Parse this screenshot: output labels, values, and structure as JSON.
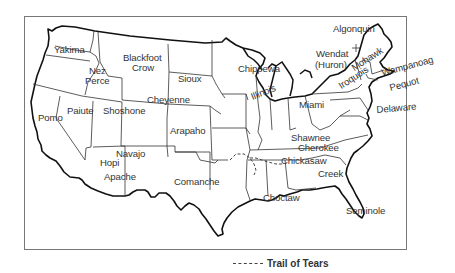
{
  "map": {
    "title": "Native American Tribes of the United States",
    "tribes": [
      {
        "name": "Yakima",
        "x": 54,
        "y": 45
      },
      {
        "name": "Nez",
        "x": 89,
        "y": 66
      },
      {
        "name": "Perce",
        "x": 85,
        "y": 76
      },
      {
        "name": "Blackfoot",
        "x": 123,
        "y": 53
      },
      {
        "name": "Crow",
        "x": 132,
        "y": 63
      },
      {
        "name": "Sioux",
        "x": 178,
        "y": 74
      },
      {
        "name": "Cheyenne",
        "x": 147,
        "y": 95
      },
      {
        "name": "Shoshone",
        "x": 103,
        "y": 106
      },
      {
        "name": "Paiute",
        "x": 67,
        "y": 106
      },
      {
        "name": "Pomo",
        "x": 38,
        "y": 113
      },
      {
        "name": "Arapaho",
        "x": 170,
        "y": 126
      },
      {
        "name": "Navajo",
        "x": 116,
        "y": 149
      },
      {
        "name": "Hopi",
        "x": 100,
        "y": 158
      },
      {
        "name": "Apache",
        "x": 104,
        "y": 172
      },
      {
        "name": "Comanche",
        "x": 174,
        "y": 177
      },
      {
        "name": "Chippewa",
        "x": 238,
        "y": 64
      },
      {
        "name": "Illinois",
        "x": 253,
        "y": 92,
        "rotate": -22
      },
      {
        "name": "Miami",
        "x": 299,
        "y": 100
      },
      {
        "name": "Shawnee",
        "x": 291,
        "y": 133
      },
      {
        "name": "Cherokee",
        "x": 298,
        "y": 143
      },
      {
        "name": "Chickasaw",
        "x": 281,
        "y": 156
      },
      {
        "name": "Creek",
        "x": 318,
        "y": 169
      },
      {
        "name": "Choctaw",
        "x": 263,
        "y": 193
      },
      {
        "name": "Seminole",
        "x": 346,
        "y": 206
      },
      {
        "name": "Algonquin",
        "x": 333,
        "y": 24
      },
      {
        "name": "Wendat",
        "x": 316,
        "y": 49
      },
      {
        "name": "(Huron)",
        "x": 315,
        "y": 60
      },
      {
        "name": "Mohawk",
        "x": 355,
        "y": 63,
        "rotate": -33
      },
      {
        "name": "Iroquois",
        "x": 342,
        "y": 81,
        "rotate": -33
      },
      {
        "name": "Wampanoag",
        "x": 383,
        "y": 68,
        "rotate": -15
      },
      {
        "name": "Pequot",
        "x": 391,
        "y": 83,
        "rotate": -15
      },
      {
        "name": "Delaware",
        "x": 377,
        "y": 105,
        "rotate": -5
      }
    ]
  },
  "legend": {
    "trail_label": "Trail of Tears",
    "line_style": "dashed"
  }
}
